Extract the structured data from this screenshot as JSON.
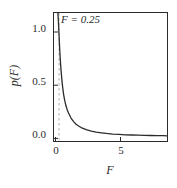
{
  "chart_data": {
    "type": "line",
    "title": "",
    "xlabel": "F",
    "ylabel": "p(F)",
    "xlim": [
      -0.15,
      8.8
    ],
    "ylim": [
      -0.035,
      1.22
    ],
    "grid": false,
    "legend": null,
    "xticks": [
      0,
      5
    ],
    "xtick_labels": [
      "0",
      "5"
    ],
    "yticks": [
      0.0,
      0.5,
      1.0
    ],
    "ytick_labels": [
      "0.0",
      "0.5",
      "1.0"
    ],
    "annotations": [
      {
        "text": "F = 0.25",
        "x": 0.25,
        "y": 1.12,
        "style": "italic"
      }
    ],
    "vlines": [
      {
        "x": 0.25,
        "style": "dashed",
        "color": "#b0b0b0",
        "label": "F = 0.25"
      }
    ],
    "series": [
      {
        "name": "p(F)",
        "color": "#2b2b2b",
        "x": [
          0.1,
          0.13,
          0.16,
          0.2,
          0.25,
          0.3,
          0.35,
          0.4,
          0.5,
          0.6,
          0.7,
          0.8,
          0.9,
          1.0,
          1.2,
          1.4,
          1.6,
          1.8,
          2.0,
          2.4,
          2.8,
          3.2,
          3.6,
          4.0,
          4.5,
          5.0,
          5.5,
          6.0,
          6.5,
          7.0,
          7.5,
          8.0,
          8.5,
          8.8
        ],
        "y": [
          1.35,
          1.28,
          1.22,
          1.14,
          1.0,
          0.87,
          0.76,
          0.67,
          0.53,
          0.43,
          0.36,
          0.31,
          0.27,
          0.24,
          0.19,
          0.155,
          0.13,
          0.112,
          0.097,
          0.076,
          0.062,
          0.052,
          0.045,
          0.039,
          0.033,
          0.029,
          0.026,
          0.024,
          0.022,
          0.02,
          0.019,
          0.018,
          0.017,
          0.016
        ]
      }
    ]
  },
  "figure": {
    "frame_color": "#2b2b2b",
    "background": "#ffffff",
    "curve_color": "#2b2b2b",
    "dash_color": "#b0b0b0",
    "text_color": "#2b2b2b"
  },
  "labels": {
    "annotation": "F = 0.25",
    "ylabel": "p(F)",
    "xlabel": "F",
    "ytick_0": "0.0",
    "ytick_1": "0.5",
    "ytick_2": "1.0",
    "xtick_0": "0",
    "xtick_1": "5"
  }
}
